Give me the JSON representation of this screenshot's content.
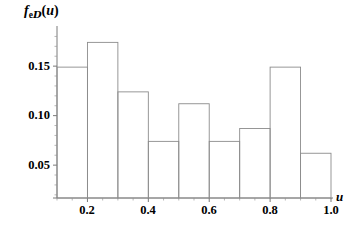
{
  "figure": {
    "background_color": "#ffffff",
    "line_color": "#8c8c8c",
    "axis_color": "#6b6b6b",
    "text_color": "#000000"
  },
  "ylabel_parts": {
    "f": "f",
    "sub_e": "e",
    "sub_d": "D",
    "open_paren": "(",
    "u": "u",
    "close_paren": ")"
  },
  "xlabel": "u",
  "yticks": [
    {
      "label": "0.15",
      "value": 0.15
    },
    {
      "label": "0.10",
      "value": 0.1
    },
    {
      "label": "0.05",
      "value": 0.05
    }
  ],
  "xticks": [
    {
      "label": "0.2",
      "value": 0.2
    },
    {
      "label": "0.4",
      "value": 0.4
    },
    {
      "label": "0.6",
      "value": 0.6
    },
    {
      "label": "0.8",
      "value": 0.8
    },
    {
      "label": "1.0",
      "value": 1.0
    }
  ],
  "chart_data": {
    "type": "bar",
    "title": "",
    "subtitle": "",
    "xlabel": "u",
    "ylabel": "f_eD(u)",
    "grid": false,
    "legend": null,
    "xlim": [
      0.1,
      1.0
    ],
    "ylim": [
      0.017,
      0.185
    ],
    "bin_width": 0.1,
    "bin_edges": [
      0.1,
      0.2,
      0.3,
      0.4,
      0.5,
      0.6,
      0.7,
      0.8,
      0.9,
      1.0
    ],
    "categories": [
      "0.1-0.2",
      "0.2-0.3",
      "0.3-0.4",
      "0.4-0.5",
      "0.5-0.6",
      "0.6-0.7",
      "0.7-0.8",
      "0.8-0.9",
      "0.9-1.0"
    ],
    "values": [
      0.149,
      0.174,
      0.124,
      0.074,
      0.112,
      0.074,
      0.087,
      0.149,
      0.062
    ],
    "ytick_values": [
      0.05,
      0.1,
      0.15
    ],
    "xtick_values": [
      0.2,
      0.4,
      0.6,
      0.8,
      1.0
    ],
    "bar_fill": "none",
    "bar_stroke": "#8c8c8c"
  },
  "geometry": {
    "plot_left": 57,
    "plot_right": 331,
    "baseline_y": 198,
    "y_value_at_baseline": 0.0168,
    "pixels_per_unit_y": 990
  }
}
